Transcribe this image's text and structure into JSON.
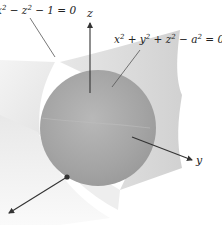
{
  "diagram": {
    "title": "",
    "surfaces": [
      {
        "id": "hyperbolic-cylinder",
        "equation_parts": [
          "x",
          "2",
          " − z",
          "2",
          " − 1 = 0"
        ],
        "visible_equation": "x² − z² − 1 = 0",
        "fill": "#d9d9d9"
      },
      {
        "id": "sphere",
        "equation_parts": [
          "x",
          "2",
          " + y",
          "2",
          " + z",
          "2",
          " − a",
          "2",
          " = 0"
        ],
        "visible_equation": "x² + y² + z² − a² = 0",
        "fill": "#a6a6a6"
      }
    ],
    "axes": {
      "z": {
        "label": "z"
      },
      "y": {
        "label": "y"
      },
      "x": {
        "label": ""
      }
    },
    "colors": {
      "background": "#ffffff",
      "axis": "#333333",
      "leader_line": "#555555",
      "text": "#222222"
    }
  }
}
